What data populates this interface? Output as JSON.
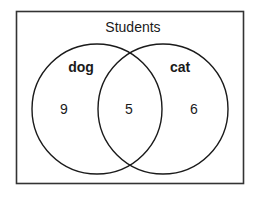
{
  "diagram": {
    "type": "venn",
    "universe_label": "Students",
    "sets": [
      {
        "name": "dog",
        "only_count": "9"
      },
      {
        "name": "cat",
        "only_count": "6"
      }
    ],
    "intersection_count": "5",
    "colors": {
      "stroke": "#1a1a1a",
      "background": "#ffffff"
    }
  }
}
